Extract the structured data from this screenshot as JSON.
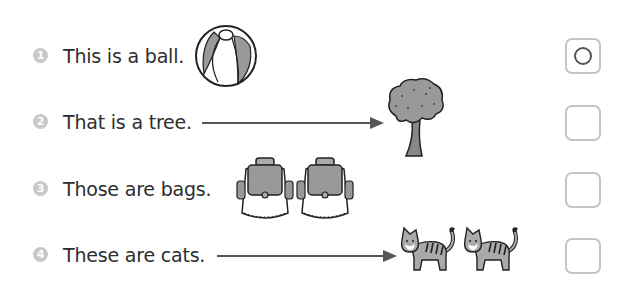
{
  "items": [
    {
      "number": "1",
      "sentence": "This is a ball.",
      "picture": "ball",
      "has_arrow": false,
      "answer": "O"
    },
    {
      "number": "2",
      "sentence": "That is a tree.",
      "picture": "tree",
      "has_arrow": true,
      "answer": ""
    },
    {
      "number": "3",
      "sentence": "Those are bags.",
      "picture": "two bags",
      "has_arrow": false,
      "answer": ""
    },
    {
      "number": "4",
      "sentence": "These are cats.",
      "picture": "two cats",
      "has_arrow": true,
      "answer": ""
    }
  ],
  "colors": {
    "number_circle": "#c8c8c8",
    "text": "#2e2e2e",
    "box_border": "#c4c4c4",
    "illustration_fill": "#999999"
  }
}
